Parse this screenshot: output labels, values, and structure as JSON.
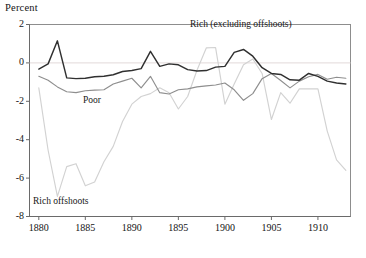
{
  "axis_title": "Percent",
  "labels": {
    "rich": "Rich (excluding offshoots)",
    "poor": "Poor",
    "rich_offshoots": "Rich offshoots"
  },
  "colors": {
    "rich": "#303030",
    "poor": "#8e8e8e",
    "rich_offshoots": "#d2d2d2",
    "frame": "#6a6a6a",
    "zero_line": "#e2d9d9"
  },
  "chart_data": {
    "type": "line",
    "title": "",
    "xlabel": "",
    "ylabel": "Percent",
    "xlim": [
      1879,
      1913.5
    ],
    "ylim": [
      -8,
      2
    ],
    "grid": false,
    "legend": "inline-annotations",
    "yticks": [
      2,
      0,
      -2,
      -4,
      -6,
      -8
    ],
    "ytick_labels": [
      "2",
      "0",
      "-2",
      "-4",
      "-6",
      "-8"
    ],
    "xticks": [
      1880,
      1885,
      1890,
      1895,
      1900,
      1905,
      1910
    ],
    "xtick_labels": [
      "1880",
      "1885",
      "1890",
      "1895",
      "1900",
      "1905",
      "1910"
    ],
    "zero_reference_line": 0,
    "x": [
      1880,
      1881,
      1882,
      1883,
      1884,
      1885,
      1886,
      1887,
      1888,
      1889,
      1890,
      1891,
      1892,
      1893,
      1894,
      1895,
      1896,
      1897,
      1898,
      1899,
      1900,
      1901,
      1902,
      1903,
      1904,
      1905,
      1906,
      1907,
      1908,
      1909,
      1910,
      1911,
      1912,
      1913
    ],
    "series": [
      {
        "name": "Rich (excluding offshoots)",
        "color": "#303030",
        "values": [
          -0.32,
          -0.05,
          1.15,
          -0.78,
          -0.82,
          -0.8,
          -0.72,
          -0.7,
          -0.62,
          -0.45,
          -0.4,
          -0.3,
          0.6,
          -0.18,
          -0.05,
          -0.1,
          -0.35,
          -0.42,
          -0.4,
          -0.22,
          -0.18,
          0.55,
          0.7,
          0.35,
          -0.25,
          -0.55,
          -0.6,
          -0.88,
          -0.9,
          -0.55,
          -0.7,
          -0.95,
          -1.05,
          -1.1
        ]
      },
      {
        "name": "Poor",
        "color": "#8e8e8e",
        "values": [
          -0.7,
          -0.9,
          -1.25,
          -1.5,
          -1.55,
          -1.45,
          -1.42,
          -1.4,
          -1.1,
          -0.95,
          -0.8,
          -1.3,
          -0.7,
          -1.55,
          -1.62,
          -1.4,
          -1.35,
          -1.25,
          -1.2,
          -1.15,
          -1.05,
          -1.4,
          -1.95,
          -1.6,
          -0.82,
          -0.55,
          -0.92,
          -1.3,
          -0.95,
          -0.72,
          -0.6,
          -0.85,
          -0.75,
          -0.8
        ]
      },
      {
        "name": "Rich offshoots",
        "color": "#d2d2d2",
        "values": [
          -1.3,
          -4.55,
          -6.95,
          -5.4,
          -5.25,
          -6.4,
          -6.2,
          -5.15,
          -4.35,
          -3.05,
          -2.15,
          -1.75,
          -1.6,
          -1.3,
          -1.55,
          -2.4,
          -1.75,
          -0.38,
          0.78,
          0.8,
          -2.15,
          -1.1,
          -0.1,
          0.2,
          -0.55,
          -2.95,
          -1.55,
          -2.1,
          -1.35,
          -1.35,
          -1.35,
          -3.55,
          -5.05,
          -5.6
        ]
      }
    ]
  }
}
